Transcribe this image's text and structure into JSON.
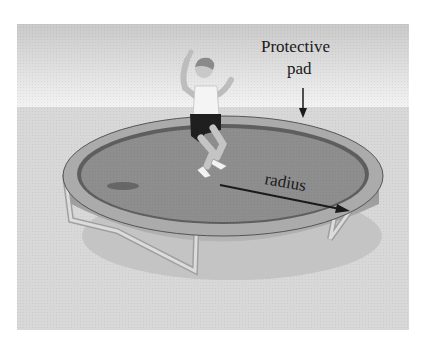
{
  "figure": {
    "labels": {
      "protective_pad_line1": "Protective",
      "protective_pad_line2": "pad",
      "radius": "radius"
    },
    "colors": {
      "sky_top": "#c9c9c9",
      "sky_bottom": "#f2f2f2",
      "ground": "#d6d6d6",
      "pad": "#a9a9a9",
      "mat": "#8c8c8c",
      "mat_ring": "#5a5a5a",
      "skirt": "#9a9a9a",
      "legs": "#d9d9d9",
      "arrow": "#1a1a1a"
    }
  }
}
